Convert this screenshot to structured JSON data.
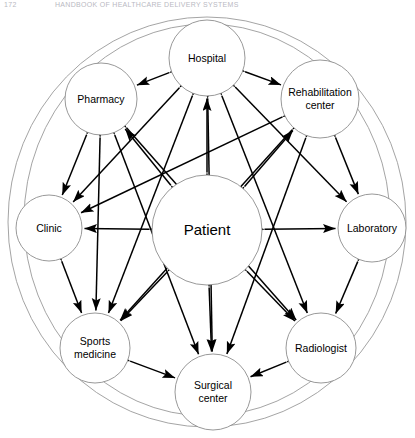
{
  "header": {
    "page_number": "172",
    "title": "HANDBOOK OF HEALTHCARE DELIVERY SYSTEMS"
  },
  "diagram": {
    "type": "network-hub-and-spoke",
    "caption_present": false,
    "outer_rings": 2,
    "center_node": {
      "id": "patient",
      "label": "Patient",
      "cx": 207,
      "cy": 230,
      "r": 55
    },
    "nodes": [
      {
        "id": "hospital",
        "label": "Hospital",
        "cx": 207,
        "cy": 58,
        "r": 38,
        "lines": [
          "Hospital"
        ]
      },
      {
        "id": "pharmacy",
        "label": "Pharmacy",
        "cx": 101,
        "cy": 99,
        "r": 36,
        "lines": [
          "Pharmacy"
        ]
      },
      {
        "id": "rehabilitation",
        "label": "Rehabilitation center",
        "cx": 320,
        "cy": 99,
        "r": 39,
        "lines": [
          "Rehabilitation",
          "center"
        ]
      },
      {
        "id": "clinic",
        "label": "Clinic",
        "cx": 49,
        "cy": 228,
        "r": 33,
        "lines": [
          "Clinic"
        ]
      },
      {
        "id": "laboratory",
        "label": "Laboratory",
        "cx": 372,
        "cy": 228,
        "r": 34,
        "lines": [
          "Laboratory"
        ]
      },
      {
        "id": "sports",
        "label": "Sports medicine",
        "cx": 95,
        "cy": 348,
        "r": 35,
        "lines": [
          "Sports",
          "medicine"
        ]
      },
      {
        "id": "radiologist",
        "label": "Radiologist",
        "cx": 321,
        "cy": 348,
        "r": 35,
        "lines": [
          "Radiologist"
        ]
      },
      {
        "id": "surgical",
        "label": "Surgical center",
        "cx": 213,
        "cy": 392,
        "r": 38,
        "lines": [
          "Surgical",
          "center"
        ]
      }
    ],
    "edges": [
      {
        "from": "patient",
        "to": "hospital",
        "arrows": "both"
      },
      {
        "from": "patient",
        "to": "pharmacy",
        "arrows": "both"
      },
      {
        "from": "patient",
        "to": "rehabilitation",
        "arrows": "both"
      },
      {
        "from": "patient",
        "to": "clinic",
        "arrows": "both"
      },
      {
        "from": "patient",
        "to": "laboratory",
        "arrows": "both"
      },
      {
        "from": "patient",
        "to": "sports",
        "arrows": "both"
      },
      {
        "from": "patient",
        "to": "radiologist",
        "arrows": "both"
      },
      {
        "from": "patient",
        "to": "surgical",
        "arrows": "both"
      },
      {
        "from": "hospital",
        "to": "pharmacy",
        "arrows": "both"
      },
      {
        "from": "hospital",
        "to": "rehabilitation",
        "arrows": "both"
      },
      {
        "from": "hospital",
        "to": "clinic",
        "arrows": "both"
      },
      {
        "from": "hospital",
        "to": "laboratory",
        "arrows": "both"
      },
      {
        "from": "hospital",
        "to": "sports",
        "arrows": "both"
      },
      {
        "from": "hospital",
        "to": "radiologist",
        "arrows": "both"
      },
      {
        "from": "hospital",
        "to": "surgical",
        "arrows": "both"
      },
      {
        "from": "pharmacy",
        "to": "clinic",
        "arrows": "both"
      },
      {
        "from": "pharmacy",
        "to": "sports",
        "arrows": "both"
      },
      {
        "from": "pharmacy",
        "to": "surgical",
        "arrows": "both"
      },
      {
        "from": "pharmacy",
        "to": "radiologist",
        "arrows": "both"
      },
      {
        "from": "rehabilitation",
        "to": "clinic",
        "arrows": "both"
      },
      {
        "from": "rehabilitation",
        "to": "laboratory",
        "arrows": "both"
      },
      {
        "from": "rehabilitation",
        "to": "surgical",
        "arrows": "both"
      },
      {
        "from": "rehabilitation",
        "to": "sports",
        "arrows": "both"
      },
      {
        "from": "clinic",
        "to": "sports",
        "arrows": "both"
      },
      {
        "from": "laboratory",
        "to": "radiologist",
        "arrows": "both"
      },
      {
        "from": "sports",
        "to": "surgical",
        "arrows": "both"
      },
      {
        "from": "radiologist",
        "to": "surgical",
        "arrows": "both"
      }
    ],
    "rings": [
      {
        "id": "outer-ring-1",
        "cx": 207,
        "cy": 222,
        "rx": 199,
        "ry": 205
      },
      {
        "id": "outer-ring-2",
        "cx": 207,
        "cy": 220,
        "rx": 183,
        "ry": 196
      }
    ]
  },
  "colors": {
    "node_stroke": "#8d8d8d",
    "edge": "#000000",
    "background": "#ffffff",
    "header_text": "#b9b9c2"
  }
}
